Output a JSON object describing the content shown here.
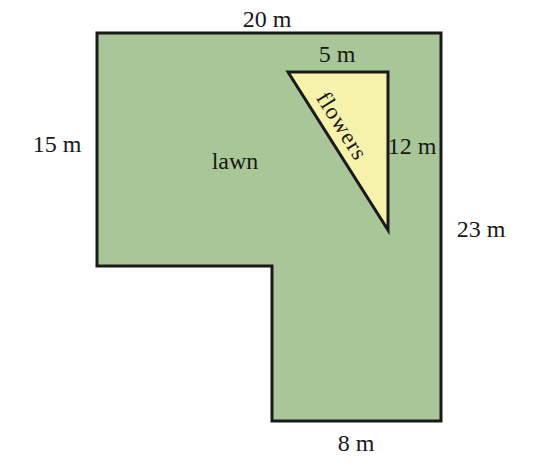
{
  "figure": {
    "regions": {
      "lawn_label": "lawn",
      "flowers_label": "flowers"
    },
    "dimensions": {
      "top_width": "20 m",
      "triangle_top": "5 m",
      "left_height": "15 m",
      "triangle_right": "12 m",
      "right_height": "23 m",
      "bottom_width": "8 m"
    },
    "colors": {
      "lawn_fill": "#a8c697",
      "flowers_fill": "#f6f2ac",
      "outline": "#1a1a1a",
      "background": "#ffffff",
      "text": "#181818"
    }
  }
}
